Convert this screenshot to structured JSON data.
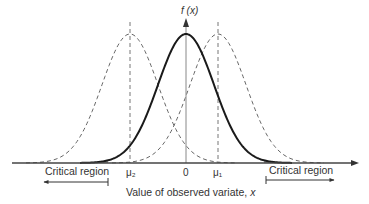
{
  "diagram": {
    "type": "hypothesis-test-normal-curves",
    "y_axis_label": "f (x)",
    "x_axis_label": "Value of observed variate, x",
    "center_label": "0",
    "left_mean_label": "μ₂",
    "right_mean_label": "μ₁",
    "critical_region_left_label": "Critical region",
    "critical_region_right_label": "Critical region",
    "curves": [
      {
        "name": "null-distribution",
        "mean": 0,
        "style": "solid"
      },
      {
        "name": "alternative-left",
        "mean_label": "μ₂",
        "style": "dashed"
      },
      {
        "name": "alternative-right",
        "mean_label": "μ₁",
        "style": "dashed"
      }
    ],
    "colors": {
      "solid_curve": "#1a1a1a",
      "dashed_curve": "#666666",
      "axis": "#444444",
      "shade": "#9a9a9a",
      "text": "#333333"
    }
  }
}
